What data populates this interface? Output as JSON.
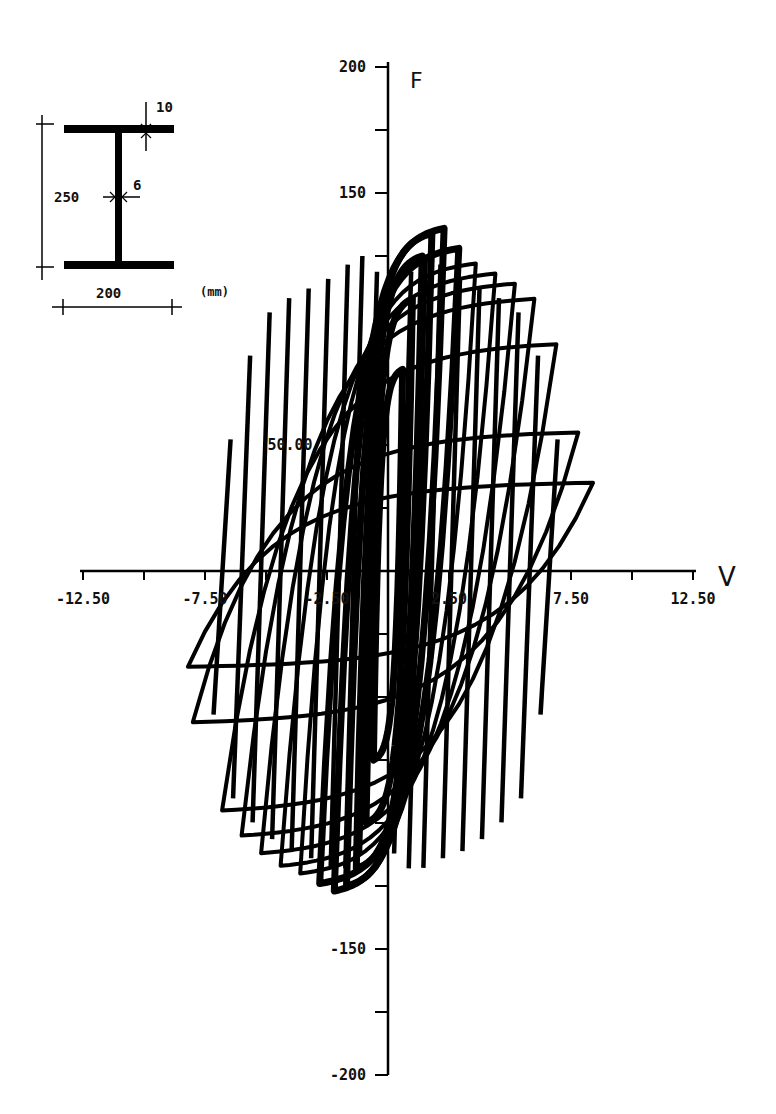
{
  "chart_data": {
    "type": "line",
    "title": "",
    "xlabel": "V",
    "ylabel": "F",
    "xlim": [
      -12.5,
      12.5
    ],
    "ylim": [
      -200,
      200
    ],
    "grid": false,
    "x_ticks": [
      -12.5,
      -10,
      -7.5,
      -5,
      -2.5,
      0,
      2.5,
      5,
      7.5,
      10,
      12.5
    ],
    "x_tick_labels": [
      {
        "value": -12.5,
        "label": "-12.50"
      },
      {
        "value": -7.5,
        "label": "-7.50"
      },
      {
        "value": -2.5,
        "label": "-2.50"
      },
      {
        "value": 2.5,
        "label": "2.50"
      },
      {
        "value": 7.5,
        "label": "7.50"
      },
      {
        "value": 12.5,
        "label": "12.50"
      }
    ],
    "y_ticks": [
      -200,
      -175,
      -150,
      -125,
      -100,
      -75,
      -50,
      -25,
      0,
      25,
      50,
      75,
      100,
      125,
      150,
      175,
      200
    ],
    "y_tick_labels": [
      {
        "value": 200,
        "label": "200"
      },
      {
        "value": 150,
        "label": "150"
      },
      {
        "value": 50,
        "label": "50.00"
      },
      {
        "value": -150,
        "label": "-150"
      },
      {
        "value": -200,
        "label": "-200"
      }
    ],
    "series": [
      {
        "name": "cycle-1",
        "vmin": -0.6,
        "vmax": 0.6,
        "fmin": -75,
        "fmax": 80
      },
      {
        "name": "cycle-2",
        "vmin": -0.9,
        "vmax": 1.0,
        "fmin": -100,
        "fmax": 108
      },
      {
        "name": "cycle-3",
        "vmin": -1.3,
        "vmax": 1.4,
        "fmin": -118,
        "fmax": 125
      },
      {
        "name": "cycle-4",
        "vmin": -1.7,
        "vmax": 1.8,
        "fmin": -125,
        "fmax": 134
      },
      {
        "name": "cycle-5",
        "vmin": -2.2,
        "vmax": 2.3,
        "fmin": -127,
        "fmax": 136
      },
      {
        "name": "cycle-6",
        "vmin": -2.8,
        "vmax": 2.9,
        "fmin": -124,
        "fmax": 128
      },
      {
        "name": "cycle-7",
        "vmin": -3.6,
        "vmax": 3.6,
        "fmin": -120,
        "fmax": 122
      },
      {
        "name": "cycle-8",
        "vmin": -4.4,
        "vmax": 4.4,
        "fmin": -117,
        "fmax": 118
      },
      {
        "name": "cycle-9",
        "vmin": -5.2,
        "vmax": 5.2,
        "fmin": -112,
        "fmax": 114
      },
      {
        "name": "cycle-10",
        "vmin": -6.0,
        "vmax": 6.0,
        "fmin": -105,
        "fmax": 108
      },
      {
        "name": "cycle-11",
        "vmin": -6.8,
        "vmax": 6.9,
        "fmin": -95,
        "fmax": 90
      },
      {
        "name": "cycle-12",
        "vmin": -8.0,
        "vmax": 7.8,
        "fmin": -60,
        "fmax": 55
      },
      {
        "name": "cycle-13",
        "vmin": -8.2,
        "vmax": 8.4,
        "fmin": -38,
        "fmax": 35
      }
    ]
  },
  "axes": {
    "x_name": "V",
    "y_name": "F"
  },
  "inset": {
    "title": "I-section cross-section",
    "flange_thickness": "10",
    "web_thickness": "6",
    "height": "250",
    "width": "200",
    "units": "(mm)"
  }
}
